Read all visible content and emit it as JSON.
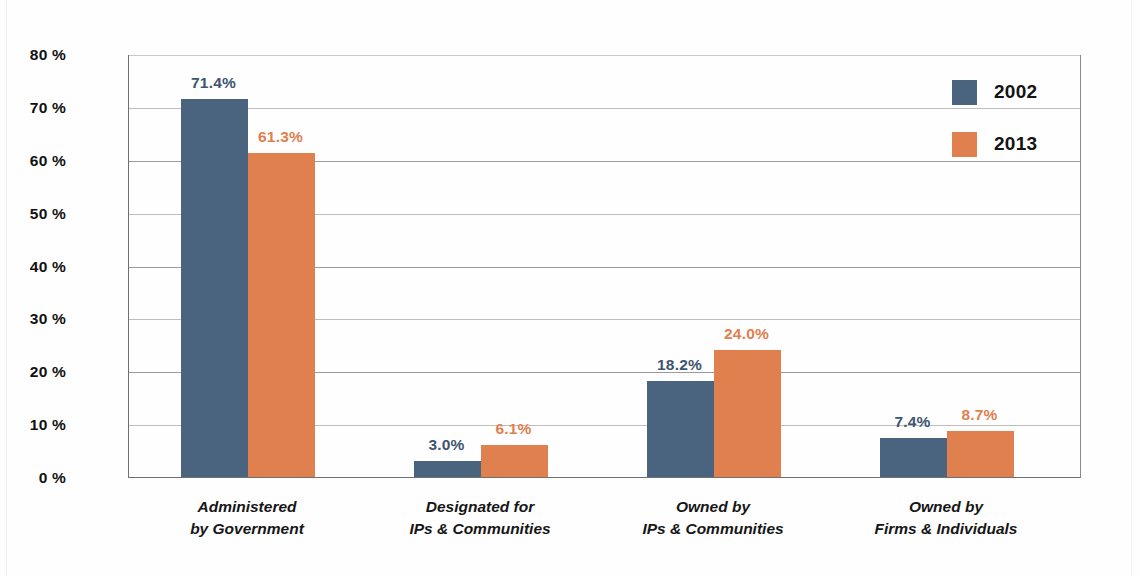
{
  "chart_data": {
    "type": "bar",
    "title": "",
    "subtitle": "",
    "xlabel": "",
    "ylabel": "",
    "ylim": [
      0,
      80
    ],
    "ytick_labels": [
      "0 %",
      "10 %",
      "20 %",
      "30 %",
      "40 %",
      "50 %",
      "60 %",
      "70 %",
      "80 %"
    ],
    "ytick_values": [
      0,
      10,
      20,
      30,
      40,
      50,
      60,
      70,
      80
    ],
    "grid": "horizontal",
    "legend_position": "top-right",
    "categories": [
      "Administered by Government",
      "Designated for IPs & Communities",
      "Owned by IPs & Communities",
      "Owned by Firms & Individuals"
    ],
    "category_lines": [
      [
        "Administered",
        "by Government"
      ],
      [
        "Designated for",
        "IPs & Communities"
      ],
      [
        "Owned by",
        "IPs & Communities"
      ],
      [
        "Owned by",
        "Firms & Individuals"
      ]
    ],
    "series": [
      {
        "name": "2002",
        "color": "#4a6480",
        "values": [
          71.4,
          3.0,
          18.2,
          7.4
        ],
        "value_labels": [
          "71.4%",
          "3.0%",
          "18.2%",
          "7.4%"
        ]
      },
      {
        "name": "2013",
        "color": "#e0804f",
        "values": [
          61.3,
          6.1,
          24.0,
          8.7
        ],
        "value_labels": [
          "61.3%",
          "6.1%",
          "24.0%",
          "8.7%"
        ]
      }
    ]
  },
  "legend": {
    "items": [
      {
        "label": "2002",
        "color": "#4a6480"
      },
      {
        "label": "2013",
        "color": "#e0804f"
      }
    ]
  },
  "colors": {
    "series_2002": "#4a6480",
    "series_2013": "#e0804f",
    "axis": "#6f6f70",
    "gridline": "#bdbdbd",
    "background": "#ffffff"
  }
}
